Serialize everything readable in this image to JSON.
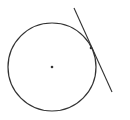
{
  "diagram": {
    "title": "",
    "stroke_color": "#333333",
    "circle": {
      "cx": 52,
      "cy": 67,
      "r": 44
    },
    "center_point": {
      "x": 52,
      "y": 67
    },
    "tangent_line": {
      "x1": 74,
      "y1": 8,
      "x2": 112,
      "y2": 92
    },
    "tangent_point": {
      "x": 91,
      "y": 48
    }
  }
}
